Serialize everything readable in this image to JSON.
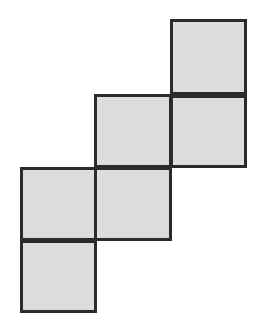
{
  "canvas": {
    "width": 260,
    "height": 331,
    "background_color": "#ffffff",
    "title": "Staircase arrangement of six congruent squares"
  },
  "style": {
    "fill_color": "#dcdcdc",
    "stroke_color": "#2b2b2b",
    "stroke_width": 3,
    "fill_texture": "fine-gray-noise"
  },
  "grid": {
    "columns": [
      {
        "name": "col-1",
        "x_start": 20,
        "x_end": 97
      },
      {
        "name": "col-2",
        "x_start": 96,
        "x_end": 172
      },
      {
        "name": "col-3",
        "x_start": 170,
        "x_end": 247
      }
    ],
    "rows": [
      {
        "name": "row-1",
        "y_start": 19,
        "y_end": 95
      },
      {
        "name": "row-2",
        "y_start": 95,
        "y_end": 168
      },
      {
        "name": "row-3",
        "y_start": 167,
        "y_end": 241
      },
      {
        "name": "row-4",
        "y_start": 240,
        "y_end": 313
      }
    ]
  },
  "squares": [
    {
      "id": "square-top-right",
      "label": "A",
      "column": "col-3",
      "row": "row-1",
      "x": 170,
      "y": 19,
      "width": 77,
      "height": 76
    },
    {
      "id": "square-right-middle",
      "label": "B",
      "column": "col-3",
      "row": "row-2",
      "x": 170,
      "y": 95,
      "width": 77,
      "height": 73
    },
    {
      "id": "square-center-upper",
      "label": "C",
      "column": "col-2",
      "row": "row-2",
      "x": 94,
      "y": 94,
      "width": 78,
      "height": 74
    },
    {
      "id": "square-center-lower",
      "label": "D",
      "column": "col-2",
      "row": "row-3",
      "x": 94,
      "y": 167,
      "width": 78,
      "height": 74
    },
    {
      "id": "square-left-upper",
      "label": "E",
      "column": "col-1",
      "row": "row-3",
      "x": 20,
      "y": 167,
      "width": 77,
      "height": 74
    },
    {
      "id": "square-left-lower",
      "label": "F",
      "column": "col-1",
      "row": "row-4",
      "x": 20,
      "y": 240,
      "width": 77,
      "height": 73
    }
  ],
  "summary": {
    "square_count": 6,
    "arrangement": "descending staircase from upper-right to lower-left"
  }
}
